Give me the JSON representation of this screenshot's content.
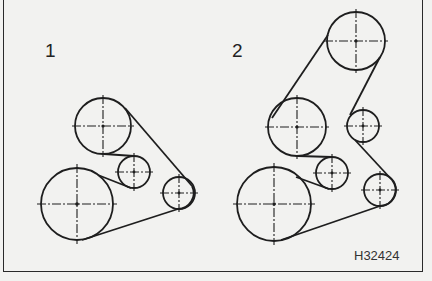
{
  "figure": {
    "panels": [
      {
        "label": "1",
        "pulleys": [
          {
            "name": "upper",
            "cx": 103,
            "cy": 126,
            "r": 28
          },
          {
            "name": "idler-middle",
            "cx": 134,
            "cy": 172,
            "r": 16
          },
          {
            "name": "right",
            "cx": 179,
            "cy": 193,
            "r": 16
          },
          {
            "name": "crankshaft",
            "cx": 77,
            "cy": 204,
            "r": 36
          }
        ],
        "belt": "M 85 104 L 80 104"
      },
      {
        "label": "2",
        "pulleys": [
          {
            "name": "top",
            "cx": 356,
            "cy": 41,
            "r": 29
          },
          {
            "name": "middle-left",
            "cx": 297,
            "cy": 127,
            "r": 29
          },
          {
            "name": "middle-right",
            "cx": 363,
            "cy": 126,
            "r": 16
          },
          {
            "name": "idler-middle",
            "cx": 332,
            "cy": 173,
            "r": 16
          },
          {
            "name": "right",
            "cx": 380,
            "cy": 190,
            "r": 16
          },
          {
            "name": "crankshaft",
            "cx": 274,
            "cy": 204,
            "r": 37
          }
        ]
      }
    ],
    "reference_code": "H32424",
    "stroke_color": "#1e1e1e",
    "background_color": "#f2f2f0"
  }
}
